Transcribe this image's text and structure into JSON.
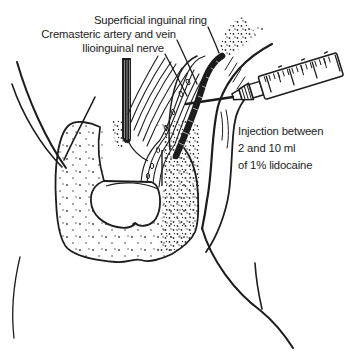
{
  "figure": {
    "background_color": "#ffffff",
    "ink_color": "#1c1c1c",
    "labels": {
      "superficial_ring": "Superficial inguinal ring",
      "cremasteric": "Cremasteric artery and vein",
      "ilioinguinal": "Ilioinguinal nerve"
    },
    "injection_note": {
      "lines": [
        "Injection between",
        "2 and 10 ml",
        "of 1% lidocaine"
      ]
    }
  }
}
